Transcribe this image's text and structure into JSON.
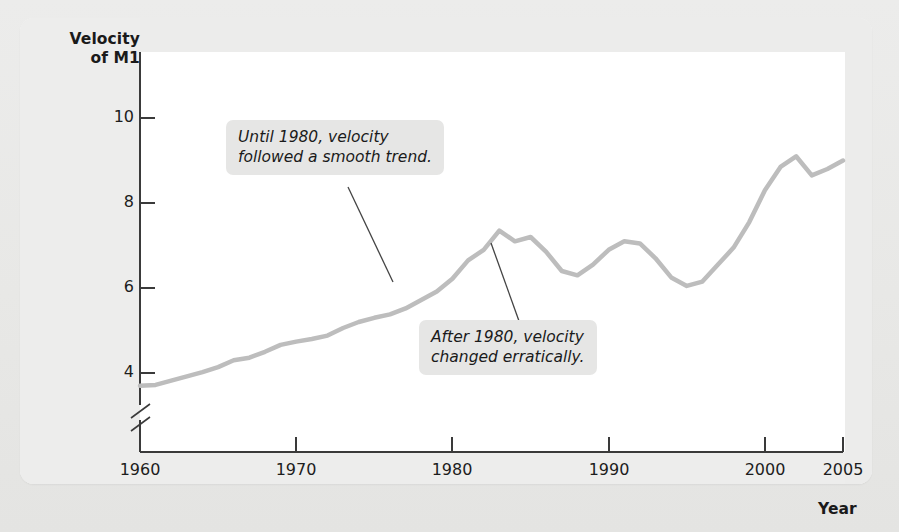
{
  "figure": {
    "y_axis_title_line1": "Velocity",
    "y_axis_title_line2": "of M1",
    "x_axis_title": "Year"
  },
  "annotations": [
    {
      "id": "until-1980",
      "text": "Until 1980, velocity\nfollowed a smooth trend."
    },
    {
      "id": "after-1980",
      "text": "After 1980, velocity\nchanged erratically."
    }
  ],
  "colors": {
    "line": "#bdbdbd",
    "axis": "#3a3a3a",
    "callout_bg": "#e6e6e5",
    "page_bg": "#e9e9e7",
    "plot_bg": "#ffffff",
    "text": "#1a1a1a"
  },
  "chart_data": {
    "type": "line",
    "title": "",
    "xlabel": "Year",
    "ylabel": "Velocity of M1",
    "xlim": [
      1960,
      2005
    ],
    "ylim": [
      3.2,
      10.6
    ],
    "y_axis_break": true,
    "y_break_below": 4,
    "grid": false,
    "legend": false,
    "xticks": [
      1960,
      1970,
      1980,
      1990,
      2000,
      2005
    ],
    "xtick_labels": [
      "1960",
      "1970",
      "1980",
      "1990",
      "2000",
      "2005"
    ],
    "yticks": [
      4,
      6,
      8,
      10
    ],
    "ytick_labels": [
      "4",
      "6",
      "8",
      "10"
    ],
    "series": [
      {
        "name": "Velocity of M1",
        "color": "#bdbdbd",
        "x": [
          1960,
          1961,
          1962,
          1963,
          1964,
          1965,
          1966,
          1967,
          1968,
          1969,
          1970,
          1971,
          1972,
          1973,
          1974,
          1975,
          1976,
          1977,
          1978,
          1979,
          1980,
          1981,
          1982,
          1983,
          1984,
          1985,
          1986,
          1987,
          1988,
          1989,
          1990,
          1991,
          1992,
          1993,
          1994,
          1995,
          1996,
          1997,
          1998,
          1999,
          2000,
          2001,
          2002,
          2003,
          2004,
          2005
        ],
        "values": [
          3.7,
          3.72,
          3.82,
          3.92,
          4.02,
          4.14,
          4.3,
          4.36,
          4.5,
          4.66,
          4.74,
          4.8,
          4.88,
          5.06,
          5.2,
          5.3,
          5.38,
          5.52,
          5.72,
          5.92,
          6.22,
          6.65,
          6.9,
          7.35,
          7.1,
          7.2,
          6.85,
          6.4,
          6.3,
          6.55,
          6.9,
          7.1,
          7.05,
          6.7,
          6.25,
          6.05,
          6.15,
          6.55,
          6.95,
          7.55,
          8.3,
          8.85,
          9.1,
          8.65,
          8.8,
          9.0
        ]
      }
    ],
    "notes": [
      "Until 1980, velocity followed a smooth trend.",
      "After 1980, velocity changed erratically."
    ]
  }
}
